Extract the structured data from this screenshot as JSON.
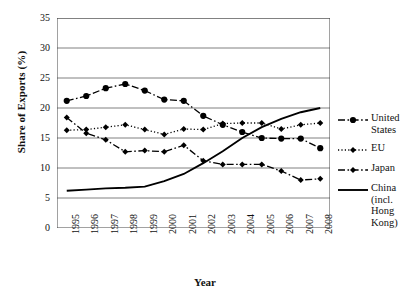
{
  "chart_data": {
    "type": "line",
    "title": "",
    "xlabel": "Year",
    "ylabel": "Share of Exports (%)",
    "categories": [
      "1995",
      "1996",
      "1997",
      "1998",
      "1999",
      "2000",
      "2001",
      "2002",
      "2003",
      "2004",
      "2005",
      "2006",
      "2007",
      "2008"
    ],
    "ylim": [
      0,
      35
    ],
    "yticks": [
      0,
      5,
      10,
      15,
      20,
      25,
      30,
      35
    ],
    "grid": "horizontal",
    "legend_position": "right",
    "series": [
      {
        "name": "United States",
        "style": "dash-dot",
        "marker": "circle",
        "color": "#000000",
        "values": [
          21.2,
          22.0,
          23.3,
          24.0,
          22.9,
          21.4,
          21.2,
          18.7,
          17.2,
          16.0,
          15.0,
          14.9,
          14.9,
          13.3
        ]
      },
      {
        "name": "EU",
        "style": "dotted",
        "marker": "diamond",
        "color": "#000000",
        "values": [
          16.3,
          16.4,
          16.8,
          17.2,
          16.4,
          15.6,
          16.5,
          16.4,
          17.4,
          17.5,
          17.5,
          16.5,
          17.2,
          17.5
        ]
      },
      {
        "name": "Japan",
        "style": "dash-dot",
        "marker": "diamond",
        "color": "#000000",
        "values": [
          18.4,
          15.8,
          14.7,
          12.7,
          12.9,
          12.7,
          13.8,
          11.2,
          10.6,
          10.6,
          10.6,
          9.5,
          8.0,
          8.2
        ]
      },
      {
        "name": "China (incl. Hong Kong)",
        "style": "solid",
        "marker": "none",
        "color": "#000000",
        "values": [
          6.2,
          6.4,
          6.6,
          6.7,
          6.9,
          7.8,
          9.0,
          10.8,
          12.8,
          15.0,
          16.8,
          18.2,
          19.3,
          20.0
        ]
      }
    ]
  },
  "legend": {
    "items": [
      {
        "label": "United States"
      },
      {
        "label": "EU"
      },
      {
        "label": "Japan"
      },
      {
        "label": "China (incl. Hong Kong)"
      }
    ]
  }
}
